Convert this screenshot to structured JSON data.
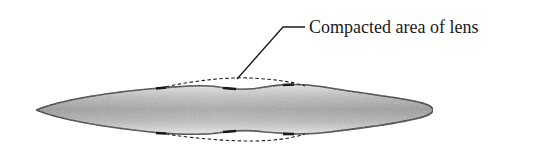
{
  "diagram": {
    "callout_label": "Compacted area of lens",
    "elements": [
      {
        "name": "lens-body",
        "description": "Elongated lens cross-section with gray shaded interior"
      },
      {
        "name": "original-outline-top",
        "style": "dashed",
        "description": "Original (uncompacted) upper contour"
      },
      {
        "name": "original-outline-bottom",
        "style": "dashed",
        "description": "Original (uncompacted) lower contour"
      },
      {
        "name": "leader-line",
        "style": "solid",
        "description": "Pointer from label to compacted area"
      }
    ],
    "colors": {
      "outline": "#1a1a1a",
      "fill_center": "#8c8c8c",
      "fill_edge": "#d6d6d6",
      "background": "#ffffff"
    }
  }
}
